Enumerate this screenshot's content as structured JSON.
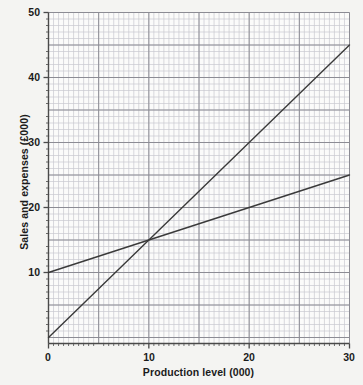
{
  "figure": {
    "background_color": "#f4f4f2",
    "plot_background_color": "#fbfbfa"
  },
  "chart_data": {
    "type": "line",
    "title": "",
    "subtitle": "",
    "xlabel": "Production level (000)",
    "ylabel": "Sales and expenses (£000)",
    "xlim": [
      0,
      30
    ],
    "ylim": [
      0,
      50
    ],
    "xticks": [
      0,
      10,
      20,
      30
    ],
    "xtick_labels": [
      "0",
      "10",
      "20",
      "30"
    ],
    "yticks": [
      10,
      20,
      30,
      40,
      50
    ],
    "ytick_labels": [
      "10",
      "20",
      "30",
      "40",
      "50"
    ],
    "grid": true,
    "grid_major_x_step": 5,
    "grid_minor_x_step": 0.5,
    "grid_major_y_step": 5,
    "grid_minor_y_step": 1,
    "grid_major_color": "#8c8c94",
    "grid_minor_color": "#c9c9d0",
    "axis_color": "#4a4a4a",
    "legend": null,
    "legend_position": "none",
    "annotations": [],
    "series": [
      {
        "name": "Sales",
        "color": "#3a3a3a",
        "x": [
          0,
          30
        ],
        "values": [
          0,
          45
        ]
      },
      {
        "name": "Total expenses",
        "color": "#3a3a3a",
        "x": [
          0,
          30
        ],
        "values": [
          10,
          25
        ]
      }
    ],
    "intersection": {
      "x": 10,
      "y": 15
    }
  }
}
